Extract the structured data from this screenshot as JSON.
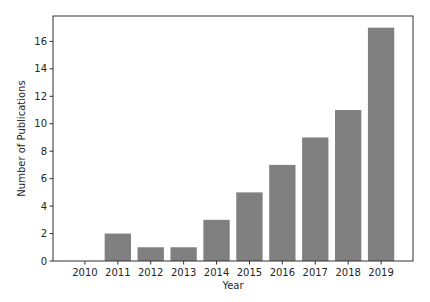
{
  "chart_data": {
    "type": "bar",
    "title": "",
    "xlabel": "Year",
    "ylabel": "Number of Publications",
    "categories": [
      "2010",
      "2011",
      "2012",
      "2013",
      "2014",
      "2015",
      "2016",
      "2017",
      "2018",
      "2019"
    ],
    "values": [
      0,
      2,
      1,
      1,
      3,
      5,
      7,
      9,
      11,
      17
    ],
    "ylim": [
      0,
      17.85
    ],
    "yticks": [
      0,
      2,
      4,
      6,
      8,
      10,
      12,
      14,
      16
    ],
    "grid": false,
    "legend": null,
    "bar_color": "#808080"
  }
}
